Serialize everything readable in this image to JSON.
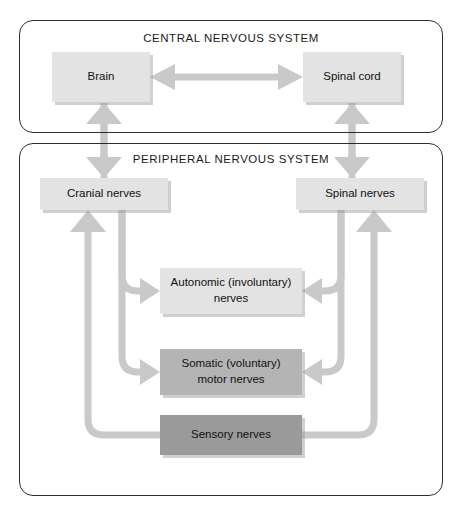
{
  "diagram": {
    "panels": [
      {
        "key": "cns",
        "title": "CENTRAL NERVOUS SYSTEM"
      },
      {
        "key": "pns",
        "title": "PERIPHERAL NERVOUS SYSTEM"
      }
    ],
    "nodes": {
      "brain": {
        "label": "Brain",
        "shade": "light"
      },
      "spinal_cord": {
        "label": "Spinal cord",
        "shade": "light"
      },
      "cranial_nerves": {
        "label": "Cranial nerves",
        "shade": "light"
      },
      "spinal_nerves": {
        "label": "Spinal nerves",
        "shade": "light"
      },
      "autonomic": {
        "label": "Autonomic (involuntary)\nnerves",
        "line1": "Autonomic (involuntary)",
        "line2": "nerves",
        "shade": "light"
      },
      "somatic": {
        "label": "Somatic (voluntary)\nmotor nerves",
        "line1": "Somatic (voluntary)",
        "line2": "motor nerves",
        "shade": "mid"
      },
      "sensory": {
        "label": "Sensory nerves",
        "line1": "Sensory nerves",
        "shade": "dark"
      }
    },
    "connections": [
      {
        "from": "brain",
        "to": "spinal_cord",
        "style": "double-arrow-horizontal"
      },
      {
        "from": "cranial_nerves",
        "to": "brain",
        "style": "arrow-up"
      },
      {
        "from": "spinal_nerves",
        "to": "spinal_cord",
        "style": "arrow-up"
      },
      {
        "from": "cranial_nerves",
        "to": "autonomic",
        "style": "arrow-right"
      },
      {
        "from": "cranial_nerves",
        "to": "somatic",
        "style": "arrow-right"
      },
      {
        "from": "spinal_nerves",
        "to": "autonomic",
        "style": "arrow-left"
      },
      {
        "from": "spinal_nerves",
        "to": "somatic",
        "style": "arrow-left"
      },
      {
        "from": "sensory",
        "to": "cranial_nerves",
        "style": "arrow-up-left-path"
      },
      {
        "from": "sensory",
        "to": "spinal_nerves",
        "style": "arrow-up-right-path"
      }
    ],
    "colors": {
      "panel_border": "#2e2e2e",
      "connector": "#c9c9c9",
      "shade_light": "#e3e3e3",
      "shade_mid": "#b4b4b4",
      "shade_dark": "#9a9a9a",
      "text": "#111111",
      "background": "#ffffff"
    }
  }
}
